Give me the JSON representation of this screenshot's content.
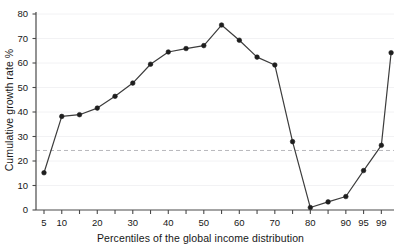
{
  "chart_data": {
    "type": "line",
    "title": "",
    "xlabel": "Percentiles of the global income distribution",
    "ylabel": "Cumulative growth rate %",
    "xlim": [
      0,
      100
    ],
    "ylim": [
      0,
      80
    ],
    "grid": false,
    "legend": "none",
    "marker": "filled-circle",
    "line_color": "#3c3c3c",
    "marker_color": "#1e1e1e",
    "reference_line": {
      "orientation": "horizontal",
      "value": 24.3,
      "style": "dashed",
      "color": "#b9b9bd"
    },
    "x": [
      5,
      10,
      15,
      20,
      25,
      30,
      35,
      40,
      45,
      50,
      55,
      60,
      65,
      70,
      75,
      80,
      85,
      90,
      95,
      99,
      100
    ],
    "values": [
      15.2,
      38.2,
      38.9,
      41.6,
      46.4,
      51.8,
      59.5,
      64.5,
      65.9,
      67.1,
      75.5,
      69.3,
      62.4,
      59.2,
      27.9,
      1.0,
      3.3,
      5.5,
      16.1,
      26.4,
      64.2
    ],
    "series": [
      {
        "name": "Cumulative growth rate",
        "values": [
          15.2,
          38.2,
          38.9,
          41.6,
          46.4,
          51.8,
          59.5,
          64.5,
          65.9,
          67.1,
          75.5,
          69.3,
          62.4,
          59.2,
          27.9,
          1.0,
          3.3,
          5.5,
          16.1,
          26.4,
          64.2
        ]
      }
    ],
    "y_ticks": [
      0,
      10,
      20,
      30,
      40,
      50,
      60,
      70,
      80
    ],
    "y_tick_labels": [
      "0",
      "10",
      "20",
      "30",
      "40",
      "50",
      "60",
      "70",
      "80"
    ],
    "x_ticks": [
      5,
      10,
      15,
      20,
      25,
      30,
      35,
      40,
      45,
      50,
      55,
      60,
      65,
      70,
      75,
      80,
      85,
      90,
      95,
      99
    ],
    "x_tick_labels": [
      "5",
      "10",
      "",
      "20",
      "",
      "30",
      "",
      "40",
      "",
      "50",
      "",
      "60",
      "",
      "70",
      "",
      "80",
      "",
      "90",
      "95",
      "99"
    ]
  },
  "axes": {
    "x_title": "Percentiles of the global income distribution",
    "y_title": "Cumulative growth rate %"
  }
}
